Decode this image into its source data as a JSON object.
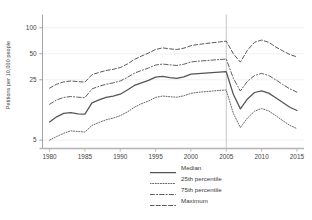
{
  "chart_data": {
    "type": "line",
    "title": "",
    "subtitle": "",
    "xlabel": "",
    "ylabel": "Petitions per 10,000 people",
    "yscale": "log",
    "ylim": [
      4.0,
      135
    ],
    "xlim": [
      1979,
      2016
    ],
    "ytick_labels": [
      "5",
      "25",
      "50",
      "100"
    ],
    "ytick_values": [
      5,
      25,
      50,
      100
    ],
    "xtick_labels": [
      "1980",
      "1985",
      "1990",
      "1995",
      "2000",
      "2005",
      "2010",
      "2015"
    ],
    "xtick_values": [
      1980,
      1985,
      1990,
      1995,
      2000,
      2005,
      2010,
      2015
    ],
    "grid": "horizontal-faint",
    "legend_position": "bottom-right",
    "annotations": [
      {
        "type": "vline",
        "x": 2005,
        "label": "",
        "color": "#b9b9b9"
      }
    ],
    "x": [
      1980,
      1981,
      1982,
      1983,
      1984,
      1985,
      1986,
      1987,
      1988,
      1989,
      1990,
      1991,
      1992,
      1993,
      1994,
      1995,
      1996,
      1997,
      1998,
      1999,
      2000,
      2001,
      2002,
      2003,
      2004,
      2005,
      2006,
      2007,
      2008,
      2009,
      2010,
      2011,
      2012,
      2013,
      2014,
      2015
    ],
    "series": [
      {
        "name": "Median",
        "style": "solid",
        "color": "#555555",
        "values": [
          8.1,
          9.3,
          10.2,
          10.4,
          10.1,
          10.0,
          13.5,
          14.6,
          15.6,
          16.2,
          17.0,
          19.0,
          21.5,
          23.0,
          24.6,
          26.8,
          27.3,
          26.5,
          26.0,
          27.0,
          29.0,
          29.5,
          29.8,
          30.2,
          30.6,
          31.0,
          17.0,
          11.5,
          15.0,
          17.8,
          18.6,
          17.5,
          15.5,
          13.6,
          12.0,
          11.0
        ]
      },
      {
        "name": "25th percentile",
        "style": "dotted",
        "color": "#6a6a6a",
        "values": [
          5.0,
          5.5,
          6.0,
          6.4,
          6.3,
          6.2,
          7.4,
          8.0,
          8.6,
          9.0,
          9.6,
          10.6,
          12.0,
          13.2,
          14.2,
          15.6,
          16.2,
          15.9,
          15.7,
          16.3,
          17.4,
          17.9,
          18.2,
          18.5,
          18.8,
          19.0,
          10.2,
          7.0,
          9.0,
          10.8,
          11.6,
          10.9,
          9.6,
          8.4,
          7.4,
          6.8
        ]
      },
      {
        "name": "75th percentile",
        "style": "dashdot",
        "color": "#5f5f5f",
        "values": [
          13.0,
          14.6,
          15.6,
          16.0,
          15.7,
          15.5,
          19.6,
          21.0,
          22.2,
          23.0,
          24.2,
          26.6,
          29.8,
          32.0,
          34.2,
          37.0,
          38.0,
          37.2,
          36.6,
          37.8,
          40.2,
          41.0,
          41.6,
          42.2,
          42.8,
          43.5,
          26.0,
          18.5,
          24.0,
          28.0,
          29.6,
          28.0,
          25.0,
          22.0,
          19.6,
          18.0
        ]
      },
      {
        "name": "Maximum",
        "style": "dashed",
        "color": "#5a5a5a",
        "values": [
          20.0,
          22.2,
          23.6,
          24.2,
          23.8,
          23.5,
          28.6,
          30.4,
          32.0,
          33.0,
          34.6,
          38.0,
          43.0,
          47.0,
          51.0,
          56.0,
          58.5,
          57.0,
          56.0,
          58.0,
          62.0,
          64.0,
          65.5,
          67.0,
          68.5,
          70.0,
          50.0,
          40.0,
          55.0,
          68.0,
          72.0,
          68.0,
          60.0,
          54.0,
          49.0,
          46.0
        ]
      }
    ]
  },
  "legend": {
    "items": [
      {
        "label": "Median"
      },
      {
        "label": "25th percentile"
      },
      {
        "label": "75th percentile"
      },
      {
        "label": "Maximum"
      }
    ]
  },
  "axes": {
    "y_axis_title": "Petitions per 10,000 people"
  }
}
